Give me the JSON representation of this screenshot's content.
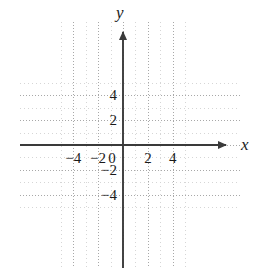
{
  "figure": {
    "kind": "cartesian-coordinate-grid",
    "background_color": "#ffffff",
    "axis_color": "#3a3a3a",
    "major_grid_color": "#a8a8a8",
    "minor_grid_color": "#d4d4d4",
    "label_color": "#1a1a1a"
  },
  "axes": {
    "x_label": "x",
    "y_label": "y",
    "origin_label": "0"
  },
  "chart_data": {
    "type": "scatter",
    "title": "",
    "xlabel": "x",
    "ylabel": "y",
    "xlim": [
      -5,
      5
    ],
    "ylim": [
      -5,
      5
    ],
    "grid": true,
    "legend": "none",
    "major_tick_step": 2,
    "minor_tick_step": 1,
    "x_ticks": [
      -4,
      -2,
      0,
      2,
      4
    ],
    "y_ticks": [
      4,
      2,
      -2,
      -4
    ],
    "x_tick_labels": [
      "−4",
      "−2",
      "0",
      "2",
      "4"
    ],
    "y_tick_labels": [
      "4",
      "2",
      "−2",
      "−4"
    ],
    "series": [
      {
        "name": "",
        "x": [],
        "y": []
      }
    ],
    "annotations": []
  }
}
